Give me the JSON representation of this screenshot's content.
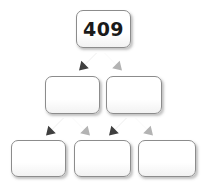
{
  "diagram": {
    "type": "factor-tree",
    "root_value": "409",
    "colors": {
      "box_border": "#8c8c8c",
      "box_fill": "#ffffff",
      "box_shadow": "rgba(120,120,120,0.45)",
      "arrow_dark": "#3f3f3f",
      "arrow_light": "#b3b3b3",
      "text": "#1a1a1a",
      "background": "#ffffff"
    },
    "rows": [
      {
        "row_index": 0,
        "name": "root-row",
        "boxes": [
          {
            "id": "box-root",
            "label": "409",
            "filled": true
          }
        ]
      },
      {
        "row_index": 1,
        "name": "level-1-row",
        "boxes": [
          {
            "id": "box-l1-left",
            "label": "",
            "filled": false
          },
          {
            "id": "box-l1-right",
            "label": "",
            "filled": false
          }
        ]
      },
      {
        "row_index": 2,
        "name": "level-2-row",
        "boxes": [
          {
            "id": "box-l2-left",
            "label": "",
            "filled": false
          },
          {
            "id": "box-l2-middle",
            "label": "",
            "filled": false
          },
          {
            "id": "box-l2-right",
            "label": "",
            "filled": false
          }
        ]
      }
    ],
    "arrows": [
      {
        "id": "arrow-root-left",
        "direction": "down-left",
        "shade": "dark",
        "icon": "arrow-down-left-icon"
      },
      {
        "id": "arrow-root-right",
        "direction": "down-right",
        "shade": "light",
        "icon": "arrow-down-right-icon"
      },
      {
        "id": "arrow-l1a-left",
        "direction": "down-left",
        "shade": "dark",
        "icon": "arrow-down-left-icon"
      },
      {
        "id": "arrow-l1a-right",
        "direction": "down-right",
        "shade": "light",
        "icon": "arrow-down-right-icon"
      },
      {
        "id": "arrow-l1b-left",
        "direction": "down-left",
        "shade": "dark",
        "icon": "arrow-down-left-icon"
      },
      {
        "id": "arrow-l1b-right",
        "direction": "down-right",
        "shade": "light",
        "icon": "arrow-down-right-icon"
      }
    ]
  }
}
